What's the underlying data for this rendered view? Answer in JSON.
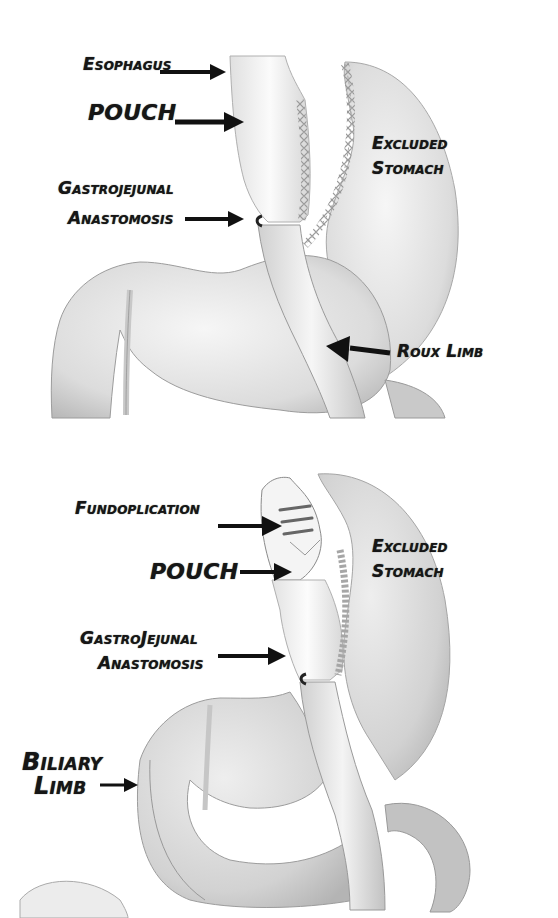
{
  "figure": {
    "panels": [
      {
        "id": "top",
        "description": "Roux-en-Y gastric bypass",
        "labels": {
          "esophagus": "Esophagus",
          "pouch": "POUCH",
          "gastrojejunal_1": "Gastrojejunal",
          "gastrojejunal_2": "Anastomosis",
          "excluded_1": "Excluded",
          "excluded_2": "Stomach",
          "roux_limb": "Roux Limb"
        }
      },
      {
        "id": "bottom",
        "description": "Roux-en-Y gastric bypass with fundoplication",
        "labels": {
          "fundoplication": "Fundoplication",
          "pouch": "POUCH",
          "gastrojejunal_1": "GastroJejunal",
          "gastrojejunal_2": "Anastomosis",
          "excluded_1": "Excluded",
          "excluded_2": "Stomach",
          "biliary_1": "Biliary",
          "biliary_2": "Limb"
        }
      }
    ],
    "colors": {
      "background": "#ffffff",
      "label_text": "#161616",
      "arrow": "#111111",
      "organ_fill_light": "#f2f2f2",
      "organ_fill_mid": "#dcdcdc",
      "organ_shade": "#b9b9b9",
      "outline": "#8a8a8a",
      "staple": "#9a9a9a"
    }
  }
}
